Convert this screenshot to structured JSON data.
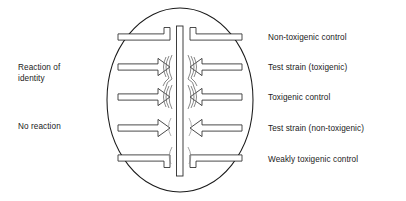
{
  "figure": {
    "dish": {
      "name": "petri-dish",
      "center_x": 180,
      "center_y": 100,
      "radius_x": 73,
      "radius_y": 92,
      "stroke": "#1a1a1a",
      "fill": "#ffffff"
    },
    "antitoxin_strip": {
      "name": "antitoxin-filter-paper-strip",
      "x": 176,
      "y": 26,
      "width": 7,
      "height": 150,
      "stroke": "#1a1a1a"
    },
    "rows": [
      {
        "index": 0,
        "y": 37,
        "arcs_left": 0,
        "arcs_right": 0,
        "label": "Non-toxigenic control"
      },
      {
        "index": 1,
        "y": 67,
        "arcs_left": 3,
        "arcs_right": 3,
        "label": "Test strain (toxigenic)"
      },
      {
        "index": 2,
        "y": 97,
        "arcs_left": 3,
        "arcs_right": 3,
        "label": "Toxigenic control"
      },
      {
        "index": 3,
        "y": 128,
        "arcs_left": 1,
        "arcs_right": 1,
        "label": "Test strain (non-toxigenic)"
      },
      {
        "index": 4,
        "y": 158,
        "arcs_left": 1,
        "arcs_right": 1,
        "label": "Weakly toxigenic control"
      }
    ]
  },
  "labels": {
    "left": [
      {
        "key": "identity",
        "text": "Reaction of\nidentity",
        "line1": "Reaction of",
        "line2": "identity"
      },
      {
        "key": "no_reaction",
        "text": "No reaction",
        "line1": "No reaction",
        "line2": ""
      }
    ],
    "right": [
      "Non-toxigenic control",
      "Test strain (toxigenic)",
      "Toxigenic control",
      "Test strain (non-toxigenic)",
      "Weakly toxigenic control"
    ]
  },
  "colors": {
    "ink": "#1a1a1a",
    "line": "#2b2b2b",
    "background": "#ffffff"
  }
}
